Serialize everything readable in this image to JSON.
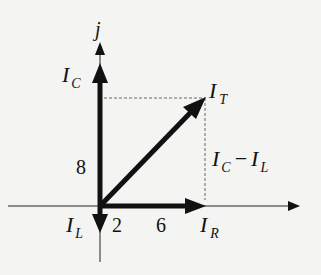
{
  "diagram": {
    "type": "phasor-diagram",
    "axis_imag_label": "j",
    "phasors": {
      "IC": {
        "label": "I",
        "sub": "C",
        "magnitude_label": "8"
      },
      "IL": {
        "label": "I",
        "sub": "L",
        "magnitude_label": "2"
      },
      "IR": {
        "label": "I",
        "sub": "R",
        "magnitude_label": "6"
      },
      "IT": {
        "label": "I",
        "sub": "T"
      }
    },
    "difference_label": {
      "a": "I",
      "a_sub": "C",
      "op": "−",
      "b": "I",
      "b_sub": "L"
    },
    "colors": {
      "ink": "#111111",
      "background": "#f4f4f2",
      "dashed": "#666666"
    }
  }
}
